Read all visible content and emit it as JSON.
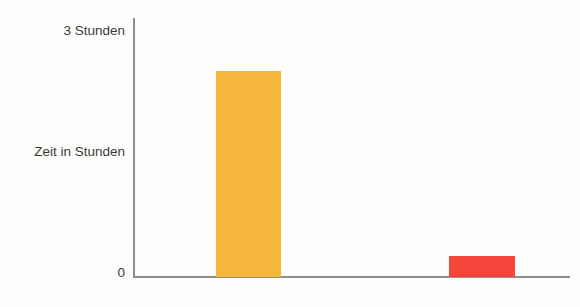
{
  "chart_data": {
    "type": "bar",
    "title": "",
    "subtitle": "",
    "xlabel": "",
    "ylabel": "Zeit in Stunden",
    "categories": [
      "",
      ""
    ],
    "values": [
      2.5,
      0.25
    ],
    "ylim": [
      0,
      3
    ],
    "yticks": [
      0,
      3
    ],
    "ytick_labels": [
      "0",
      "3 Stunden"
    ],
    "grid": false,
    "legend": false,
    "series": [
      {
        "name": "",
        "values": [
          2.5,
          0.25
        ],
        "colors": [
          "#f5b83d",
          "#f4463a"
        ]
      }
    ],
    "bars": [
      {
        "name": "bar-orange",
        "value": 2.5,
        "color": "#f5b83d"
      },
      {
        "name": "bar-red",
        "value": 0.25,
        "color": "#f4463a"
      }
    ]
  },
  "axis": {
    "y_title": "Zeit in Stunden",
    "y_top_label": "3 Stunden",
    "y_zero_label": "0",
    "line_color": "#8d8d8d"
  },
  "colors": {
    "orange": "#f5b83d",
    "red": "#f4463a",
    "axis": "#8d8d8d",
    "text": "#3b3b3b",
    "background": "#fdfdfc"
  }
}
